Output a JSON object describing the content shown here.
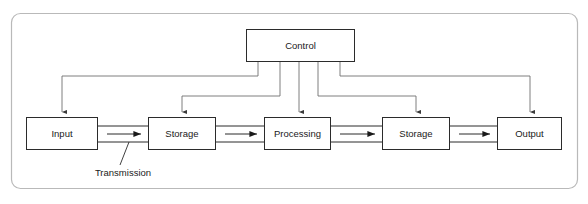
{
  "diagram": {
    "frame": {
      "name": "outer-frame"
    },
    "colors": {
      "background": "#ffffff",
      "node_stroke": "#2b2b2b",
      "node_fill": "#ffffff",
      "frame_stroke": "#b9b9b9",
      "control_line": "#6f6f6f",
      "text": "#1a1a1a"
    },
    "nodes": [
      {
        "id": "control",
        "label": "Control",
        "x": 246,
        "y": 29,
        "w": 109,
        "h": 33
      },
      {
        "id": "input",
        "label": "Input",
        "x": 26,
        "y": 117,
        "w": 72,
        "h": 33
      },
      {
        "id": "storage1",
        "label": "Storage",
        "x": 148,
        "y": 117,
        "w": 68,
        "h": 33
      },
      {
        "id": "processing",
        "label": "Processing",
        "x": 264,
        "y": 117,
        "w": 67,
        "h": 33
      },
      {
        "id": "storage2",
        "label": "Storage",
        "x": 382,
        "y": 117,
        "w": 68,
        "h": 33
      },
      {
        "id": "output",
        "label": "Output",
        "x": 497,
        "y": 117,
        "w": 65,
        "h": 33
      }
    ],
    "annotations": [
      {
        "id": "transmission",
        "label": "Transmission",
        "x": 123,
        "y": 173
      }
    ],
    "flow_connections": [
      {
        "from": "input",
        "to": "storage1",
        "type": "transmission-channel"
      },
      {
        "from": "storage1",
        "to": "processing",
        "type": "transmission-channel"
      },
      {
        "from": "processing",
        "to": "storage2",
        "type": "transmission-channel"
      },
      {
        "from": "storage2",
        "to": "output",
        "type": "transmission-channel"
      }
    ],
    "control_connections": [
      {
        "from": "control",
        "to": "input",
        "direction": "down"
      },
      {
        "from": "control",
        "to": "storage1",
        "direction": "down"
      },
      {
        "from": "control",
        "to": "processing",
        "direction": "down"
      },
      {
        "from": "control",
        "to": "storage2",
        "direction": "down"
      },
      {
        "from": "control",
        "to": "output",
        "direction": "down"
      }
    ]
  }
}
